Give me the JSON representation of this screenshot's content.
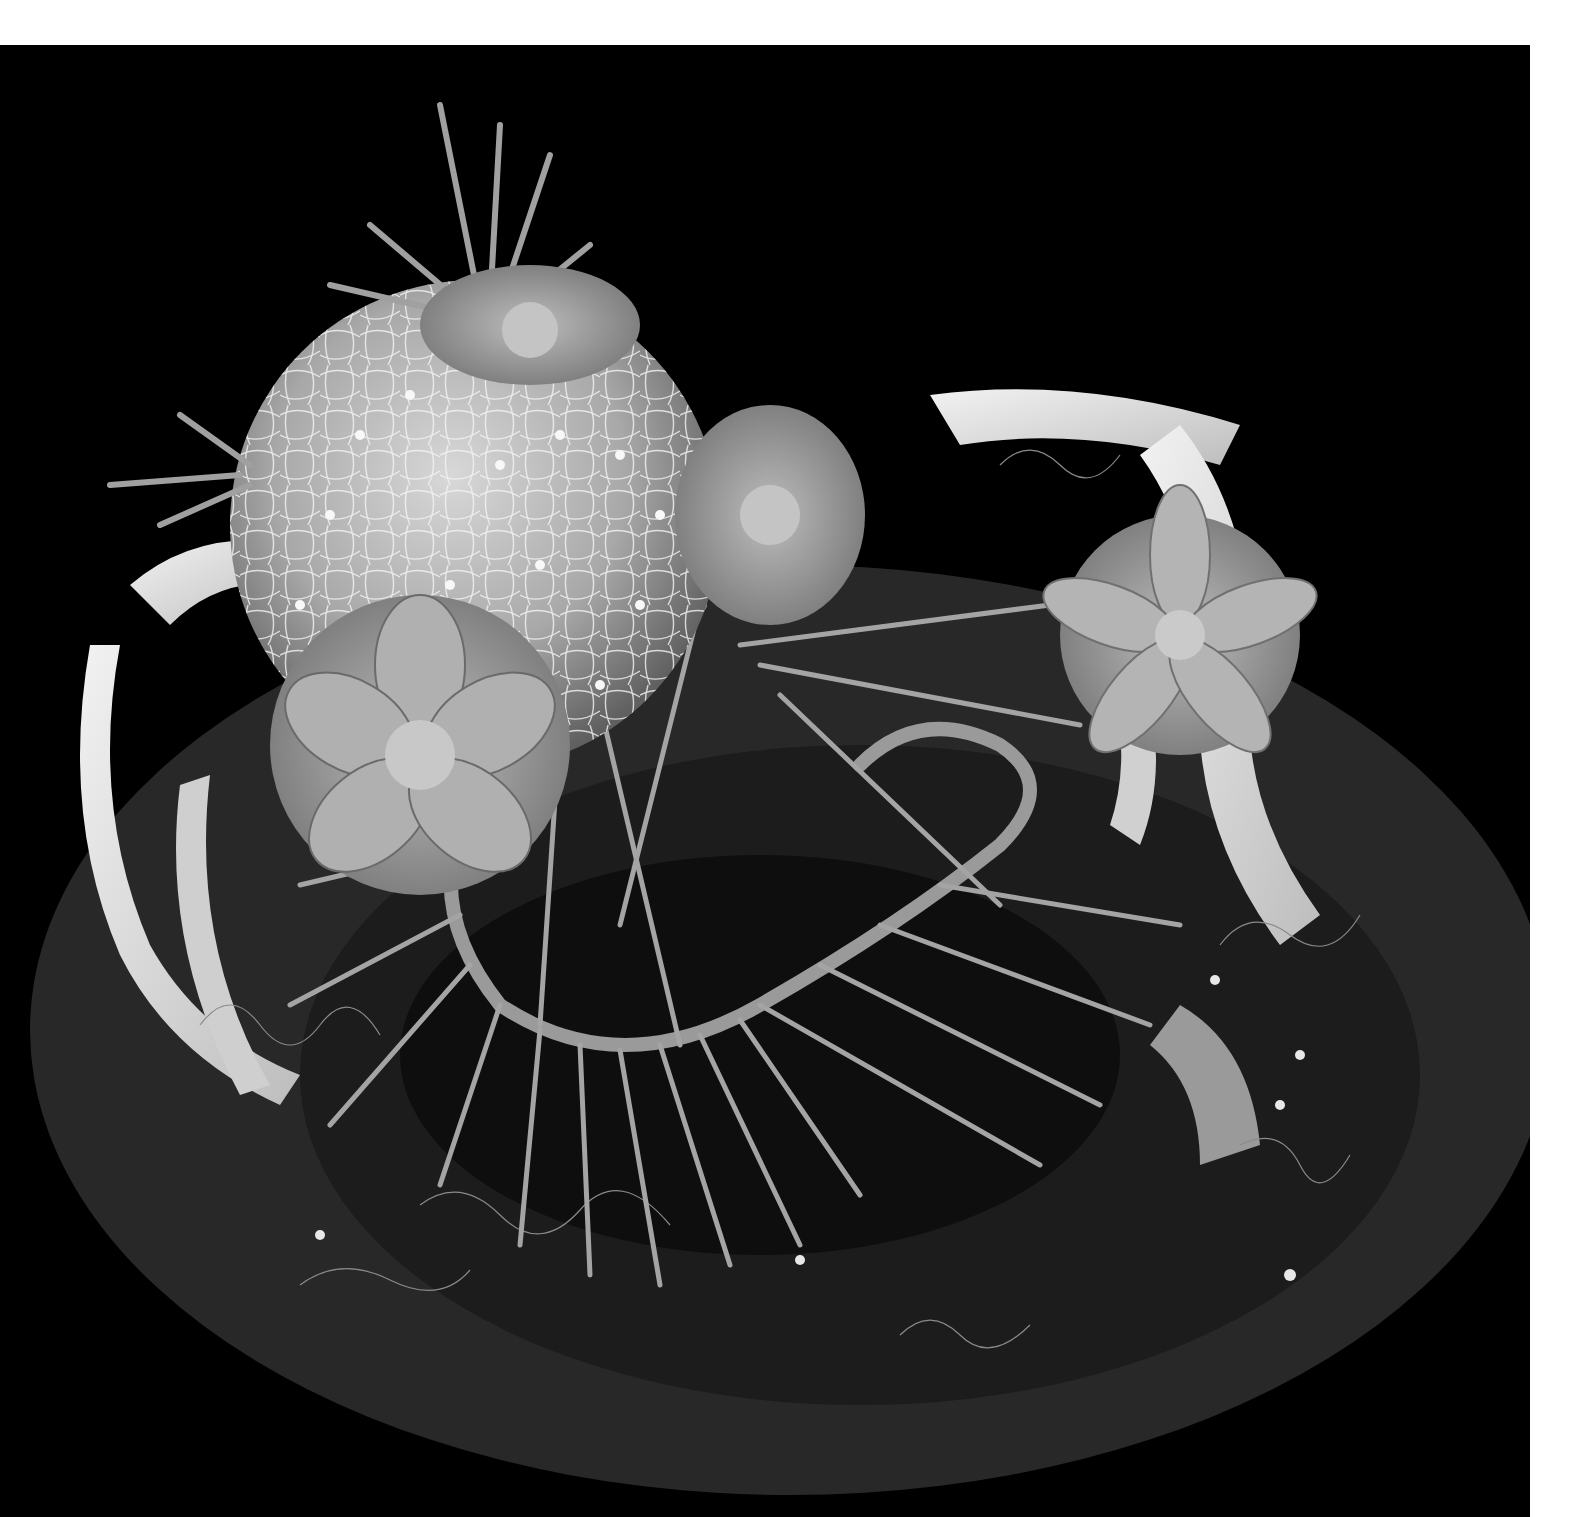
{
  "image": {
    "kind": "photograph",
    "color_mode": "grayscale",
    "alt": "Floral arrangement on a dark round platter: a woven wire ball with pearls, echeveria succulents, spiky thorn-fringed stems, curled birch-bark ribbons, and tufts of Spanish moss against a black background",
    "background_color": "#000000",
    "border_color": "#ffffff",
    "platter_color": "#2a2a2a"
  },
  "subjects": [
    {
      "name": "wire-ball",
      "desc": "Tangled wire sphere dotted with pearls"
    },
    {
      "name": "echeveria-left",
      "desc": "Rosette succulent at lower left of ball"
    },
    {
      "name": "echeveria-top",
      "desc": "Succulent rosette atop the ball"
    },
    {
      "name": "echeveria-center",
      "desc": "Succulent at the center-right of ball"
    },
    {
      "name": "echeveria-right",
      "desc": "Succulent on the bark ribbon at right"
    },
    {
      "name": "thorn-loop",
      "desc": "Looping stem fringed with long spiky thorns"
    },
    {
      "name": "bark-ribbons",
      "desc": "Curled white birch-bark ribbons"
    },
    {
      "name": "spanish-moss",
      "desc": "Wispy moss tufts around the base"
    },
    {
      "name": "platter",
      "desc": "Dark round platter under the arrangement"
    }
  ]
}
